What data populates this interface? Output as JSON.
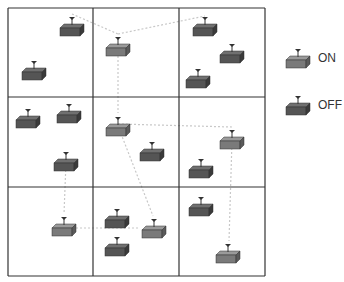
{
  "legend": {
    "on_label": "ON",
    "off_label": "OFF"
  },
  "colors": {
    "grid": "#333333",
    "link": "#c8c8c8",
    "on_front": "#7a7a7a",
    "on_top": "#9a9a9a",
    "on_side": "#5a5a5a",
    "off_front": "#555555",
    "off_top": "#707070",
    "off_side": "#3a3a3a"
  },
  "grid": {
    "x": [
      8,
      93,
      179,
      265
    ],
    "y": [
      8,
      97,
      187,
      276
    ]
  },
  "nodes": [
    {
      "id": "n1",
      "x": 72,
      "y": 18,
      "state": "off"
    },
    {
      "id": "n2",
      "x": 34,
      "y": 62,
      "state": "off"
    },
    {
      "id": "n3",
      "x": 118,
      "y": 38,
      "state": "on"
    },
    {
      "id": "n4",
      "x": 205,
      "y": 18,
      "state": "off"
    },
    {
      "id": "n5",
      "x": 232,
      "y": 45,
      "state": "off"
    },
    {
      "id": "n6",
      "x": 198,
      "y": 70,
      "state": "off"
    },
    {
      "id": "n7",
      "x": 28,
      "y": 110,
      "state": "off"
    },
    {
      "id": "n8",
      "x": 69,
      "y": 105,
      "state": "off"
    },
    {
      "id": "n9",
      "x": 66,
      "y": 153,
      "state": "off"
    },
    {
      "id": "n10",
      "x": 118,
      "y": 118,
      "state": "on"
    },
    {
      "id": "n11",
      "x": 152,
      "y": 143,
      "state": "off"
    },
    {
      "id": "n12",
      "x": 232,
      "y": 131,
      "state": "on"
    },
    {
      "id": "n13",
      "x": 201,
      "y": 160,
      "state": "off"
    },
    {
      "id": "n14",
      "x": 64,
      "y": 218,
      "state": "on"
    },
    {
      "id": "n15",
      "x": 117,
      "y": 210,
      "state": "off"
    },
    {
      "id": "n16",
      "x": 117,
      "y": 238,
      "state": "off"
    },
    {
      "id": "n17",
      "x": 154,
      "y": 220,
      "state": "on"
    },
    {
      "id": "n18",
      "x": 201,
      "y": 198,
      "state": "off"
    },
    {
      "id": "n19",
      "x": 228,
      "y": 245,
      "state": "on"
    }
  ],
  "links": [
    [
      72,
      14,
      118,
      34
    ],
    [
      118,
      34,
      205,
      16
    ],
    [
      118,
      48,
      118,
      113
    ],
    [
      118,
      124,
      232,
      127
    ],
    [
      232,
      140,
      229,
      241
    ],
    [
      118,
      126,
      153,
      216
    ],
    [
      66,
      162,
      64,
      214
    ],
    [
      72,
      228,
      140,
      228
    ]
  ],
  "legend_items": [
    {
      "x": 298,
      "y": 50,
      "state": "on"
    },
    {
      "x": 298,
      "y": 97,
      "state": "off"
    }
  ]
}
